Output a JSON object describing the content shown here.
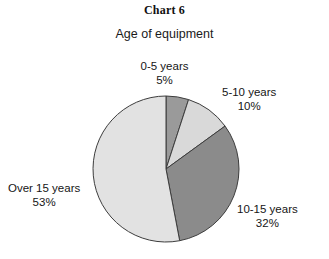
{
  "chart_data": {
    "type": "pie",
    "title": "Chart 6",
    "subtitle": "Age of equipment",
    "xlabel": "",
    "ylabel": "",
    "legend_position": "none",
    "grid": false,
    "start_angle_deg": 0,
    "direction": "clockwise",
    "categories": [
      "0-5 years",
      "5-10 years",
      "10-15 years",
      "Over 15 years"
    ],
    "values": [
      5,
      10,
      32,
      53
    ],
    "value_unit": "%",
    "slices": [
      {
        "label": "0-5 years",
        "percent_text": "5%",
        "value": 5,
        "color": "#9a9a9a",
        "stroke": "#3d3d3d"
      },
      {
        "label": "5-10 years",
        "percent_text": "10%",
        "value": 10,
        "color": "#d9d9d9",
        "stroke": "#3d3d3d"
      },
      {
        "label": "10-15 years",
        "percent_text": "32%",
        "value": 32,
        "color": "#8b8b8b",
        "stroke": "#3d3d3d"
      },
      {
        "label": "Over 15 years",
        "percent_text": "53%",
        "value": 53,
        "color": "#e2e2e2",
        "stroke": "#3d3d3d"
      }
    ]
  },
  "colors": {
    "background": "#ffffff",
    "text": "#1a1a1a",
    "outline": "#3d3d3d"
  }
}
